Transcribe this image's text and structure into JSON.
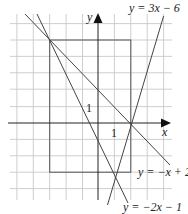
{
  "diagram": {
    "axes": {
      "x_label": "x",
      "y_label": "y",
      "x_tick_label": "1",
      "y_tick_label": "1"
    },
    "lines": [
      {
        "label": "y = 3x − 6",
        "slope": 3,
        "intercept": -6
      },
      {
        "label": "y = −x + 2",
        "slope": -1,
        "intercept": 2
      },
      {
        "label": "y = −2x − 1",
        "slope": -2,
        "intercept": -1
      }
    ],
    "rectangle": {
      "x_min": -3,
      "x_max": 2,
      "y_min": -3,
      "y_max": 5
    },
    "intersections": [
      {
        "x": -3,
        "y": 5
      },
      {
        "x": 2,
        "y": 0
      },
      {
        "x": 1,
        "y": -3
      }
    ],
    "grid": {
      "x_range": [
        -5,
        4
      ],
      "y_range": [
        -4,
        6
      ],
      "step": 1
    },
    "colors": {
      "grid": "#c8c8c8",
      "axis": "#222222",
      "line": "#444444"
    }
  }
}
